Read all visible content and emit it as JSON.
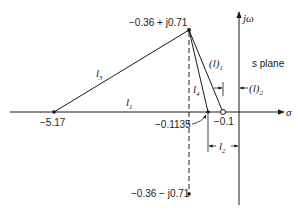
{
  "diagram": {
    "type": "s-plane pole-zero geometry",
    "plane_label": "s plane",
    "axes": {
      "real_axis_label": "σ",
      "imag_axis_label": "jω"
    },
    "points": [
      {
        "id": "pole_upper",
        "label": "−0.36 + j0.71",
        "kind": "pole"
      },
      {
        "id": "pole_lower",
        "label": "−0.36 − j0.71",
        "kind": "pole"
      },
      {
        "id": "pole_far",
        "label": "−5.17",
        "kind": "pole"
      },
      {
        "id": "pole_near",
        "label": "−0.1135",
        "kind": "pole"
      },
      {
        "id": "zero",
        "label": "−0.1",
        "kind": "zero"
      }
    ],
    "lengths": {
      "l1": "l",
      "l1_sub": "1",
      "l2": "l",
      "l2_sub": "2",
      "l3": "l",
      "l3_sub": "3",
      "l4": "l",
      "l4_sub": "4",
      "paren_l1": "(l)",
      "paren_l1_sub": "1",
      "paren_l2": "(l)",
      "paren_l2_sub": "2"
    }
  }
}
